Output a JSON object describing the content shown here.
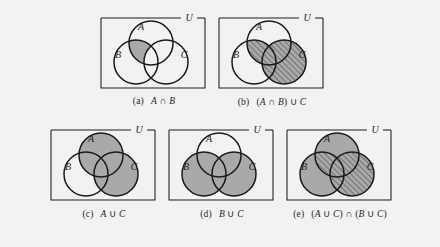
{
  "figure": {
    "background_color": "#f2f2f2",
    "fill_color": "#a9a9a9",
    "line_color": "#1a1a1a",
    "universe_label": "U",
    "set_labels": {
      "a": "A",
      "b": "B",
      "c": "C"
    }
  },
  "panels": [
    {
      "tag": "(a)",
      "expression": "A ∩ B",
      "expr_parts": [
        {
          "t": "A",
          "style": "italic"
        },
        {
          "t": " ∩ ",
          "style": "op"
        },
        {
          "t": "B",
          "style": "italic"
        }
      ],
      "shaded_regions": [
        "A∩B minus C"
      ],
      "hatched_regions": []
    },
    {
      "tag": "(b)",
      "expression": "(A ∩ B) ∪ C",
      "expr_parts": [
        {
          "t": "(",
          "style": "paren"
        },
        {
          "t": "A",
          "style": "italic"
        },
        {
          "t": " ∩ ",
          "style": "op"
        },
        {
          "t": "B",
          "style": "italic"
        },
        {
          "t": ") ∪ ",
          "style": "op"
        },
        {
          "t": "C",
          "style": "italic"
        }
      ],
      "shaded_regions": [
        "A∩B",
        "C"
      ],
      "hatched_regions": [
        "A∩B",
        "C"
      ]
    },
    {
      "tag": "(c)",
      "expression": "A ∪ C",
      "expr_parts": [
        {
          "t": "A",
          "style": "italic"
        },
        {
          "t": " ∪ ",
          "style": "op"
        },
        {
          "t": "C",
          "style": "italic"
        }
      ],
      "shaded_regions": [
        "A",
        "C"
      ],
      "hatched_regions": []
    },
    {
      "tag": "(d)",
      "expression": "B ∪ C",
      "expr_parts": [
        {
          "t": "B",
          "style": "italic"
        },
        {
          "t": " ∪ ",
          "style": "op"
        },
        {
          "t": "C",
          "style": "italic"
        }
      ],
      "shaded_regions": [
        "B",
        "C"
      ],
      "hatched_regions": []
    },
    {
      "tag": "(e)",
      "expression": "(A ∪ C) ∩ (B ∪ C)",
      "expr_parts": [
        {
          "t": "(",
          "style": "paren"
        },
        {
          "t": "A",
          "style": "italic"
        },
        {
          "t": " ∪ ",
          "style": "op"
        },
        {
          "t": "C",
          "style": "italic"
        },
        {
          "t": ") ∩ (",
          "style": "op"
        },
        {
          "t": "B",
          "style": "italic"
        },
        {
          "t": " ∪ ",
          "style": "op"
        },
        {
          "t": "C",
          "style": "italic"
        },
        {
          "t": ")",
          "style": "paren"
        }
      ],
      "shaded_regions": [
        "A",
        "B",
        "C"
      ],
      "hatched_regions": [
        "A∩B",
        "C"
      ]
    }
  ]
}
